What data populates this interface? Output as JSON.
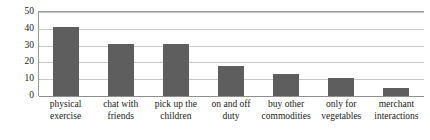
{
  "chart_data": {
    "type": "bar",
    "title": "",
    "subtitle": "",
    "xlabel": "",
    "ylabel": "",
    "ylim": [
      0,
      50
    ],
    "yticks": [
      0,
      10,
      20,
      30,
      40,
      50
    ],
    "ytick_labels": [
      "0",
      "10",
      "20",
      "30",
      "40",
      "50"
    ],
    "grid": true,
    "legend": false,
    "legend_position": "none",
    "bar_color": "#5e5e5e",
    "gridline_color": "#c8c8c8",
    "axis_color": "#8f8f8f",
    "background": "#ffffff",
    "categories": [
      "physical exercise",
      "chat with friends",
      "pick up the children",
      "on and off duty",
      "buy other commodities",
      "only for vegetables",
      "merchant interactions"
    ],
    "category_lines": [
      [
        "physical",
        "exercise"
      ],
      [
        "chat with",
        "friends"
      ],
      [
        "pick up the",
        "children"
      ],
      [
        "on and off",
        "duty"
      ],
      [
        "buy other",
        "commodities"
      ],
      [
        "only for",
        "vegetables"
      ],
      [
        "merchant",
        "interactions"
      ]
    ],
    "values": [
      41,
      31,
      31,
      18,
      13,
      11,
      5
    ],
    "series": [
      {
        "name": "",
        "values": [
          41,
          31,
          31,
          18,
          13,
          11,
          5
        ]
      }
    ]
  }
}
